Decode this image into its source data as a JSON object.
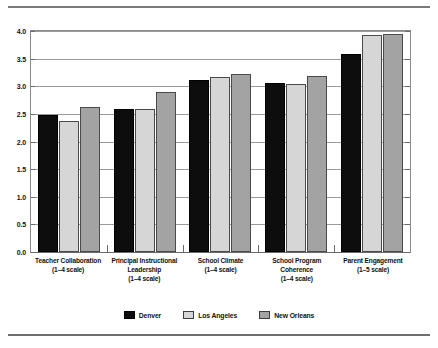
{
  "chart_data": {
    "type": "bar",
    "title": "",
    "subtitle": "",
    "xlabel": "",
    "ylabel": "",
    "ylim": [
      0.0,
      4.0
    ],
    "ytick_labels": [
      "4.0",
      "3.5",
      "3.0",
      "2.5",
      "2.0",
      "1.5",
      "1.0",
      "0.5",
      "0.0"
    ],
    "ytick_values": [
      4.0,
      3.5,
      3.0,
      2.5,
      2.0,
      1.5,
      1.0,
      0.5,
      0.0
    ],
    "grid": true,
    "legend_position": "bottom-center",
    "categories": [
      "Teacher Collaboration",
      "Principal Instructional Leadership",
      "School Climate",
      "School Program Coherence",
      "Parent Engagement"
    ],
    "category_labels": [
      {
        "name": "Teacher Collaboration",
        "scale": "(1–4 scale)"
      },
      {
        "name": "Principal Instructional Leadership",
        "scale": "(1–4 scale)"
      },
      {
        "name": "School Climate",
        "scale": "(1–4 scale)"
      },
      {
        "name": "School Program Coherence",
        "scale": "(1–4 scale)"
      },
      {
        "name": "Parent Engagement",
        "scale": "(1–5 scale)"
      }
    ],
    "series": [
      {
        "name": "Denver",
        "color": "#0d0d0d",
        "values": [
          2.48,
          2.58,
          3.11,
          3.06,
          3.59
        ]
      },
      {
        "name": "Los Angeles",
        "color": "#d6d6d6",
        "values": [
          2.37,
          2.59,
          3.16,
          3.05,
          3.93
        ]
      },
      {
        "name": "New Orleans",
        "color": "#a3a3a3",
        "values": [
          2.63,
          2.9,
          3.22,
          3.19,
          3.95
        ]
      }
    ]
  },
  "legend": {
    "items": [
      {
        "label": "Denver"
      },
      {
        "label": "Los Angeles"
      },
      {
        "label": "New Orleans"
      }
    ]
  }
}
